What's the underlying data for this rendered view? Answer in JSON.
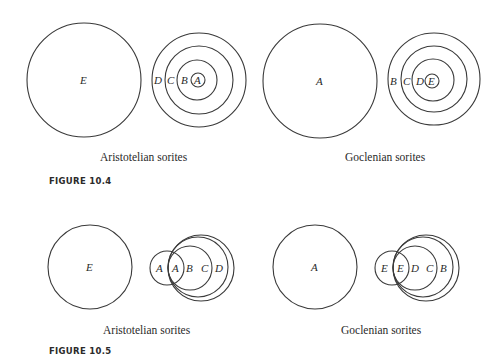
{
  "figures": [
    {
      "id": "fig-10-4",
      "figure_label": "FIGURE 10.4",
      "panels": [
        {
          "caption": "Aristotelian sorites",
          "big_circle": {
            "label": "E",
            "cx": 84,
            "cy": 80,
            "r": 57
          },
          "nested_circles": [
            {
              "label": "D",
              "cx": 199,
              "cy": 80,
              "r": 47,
              "label_x": 155
            },
            {
              "label": "C",
              "cx": 199,
              "cy": 80,
              "r": 34,
              "label_x": 169
            },
            {
              "label": "B",
              "cx": 199,
              "cy": 80,
              "r": 20,
              "label_x": 183
            },
            {
              "label": "A",
              "cx": 197,
              "cy": 80,
              "r": 7,
              "label_x": 193
            }
          ]
        },
        {
          "caption": "Goclenian sorites",
          "big_circle": {
            "label": "A",
            "cx": 320,
            "cy": 81,
            "r": 57
          },
          "nested_circles": [
            {
              "label": "B",
              "cx": 434,
              "cy": 79,
              "r": 46,
              "label_x": 390
            },
            {
              "label": "C",
              "cx": 434,
              "cy": 79,
              "r": 33,
              "label_x": 403
            },
            {
              "label": "D",
              "cx": 434,
              "cy": 79,
              "r": 21,
              "label_x": 416
            },
            {
              "label": "E",
              "cx": 432,
              "cy": 81,
              "r": 7,
              "label_x": 428
            }
          ]
        }
      ]
    },
    {
      "id": "fig-10-5",
      "figure_label": "FIGURE 10.5",
      "panels": [
        {
          "caption": "Aristotelian sorites",
          "big_circle": {
            "label": "E",
            "cx": 90,
            "cy": 267,
            "r": 42
          },
          "overlapping_circles": [
            {
              "label": "A",
              "cx": 167,
              "cy": 268,
              "r": 17,
              "label_x": 156
            },
            {
              "label": "A",
              "cx": 190,
              "cy": 268,
              "r": 22,
              "label_x": 173
            },
            {
              "label": "B",
              "cx": 198,
              "cy": 268,
              "r": 30,
              "label_x": 190
            },
            {
              "label": "C",
              "cx": 201,
              "cy": 268,
              "r": 33,
              "label_x": 204
            }
          ],
          "extra_label": {
            "label": "D",
            "x": 218,
            "y": 272
          }
        },
        {
          "caption": "Goclenian sorites",
          "big_circle": {
            "label": "A",
            "cx": 315,
            "cy": 267,
            "r": 42
          },
          "overlapping_circles": [
            {
              "label": "E",
              "cx": 392,
              "cy": 268,
              "r": 17,
              "label_x": 381
            },
            {
              "label": "E",
              "cx": 415,
              "cy": 268,
              "r": 22,
              "label_x": 398
            },
            {
              "label": "D",
              "cx": 423,
              "cy": 268,
              "r": 30,
              "label_x": 414
            },
            {
              "label": "C",
              "cx": 426,
              "cy": 268,
              "r": 33,
              "label_x": 428
            }
          ],
          "extra_label": {
            "label": "B",
            "x": 444,
            "y": 272
          }
        }
      ]
    }
  ],
  "text": {
    "fig104_left_caption": "Aristotelian sorites",
    "fig104_right_caption": "Goclenian sorites",
    "fig104_label": "FIGURE 10.4",
    "fig105_left_caption": "Aristotelian sorites",
    "fig105_right_caption": "Goclenian sorites",
    "fig105_label": "FIGURE 10.5",
    "labels": {
      "f4_big_left": "E",
      "f4_left_D": "D",
      "f4_left_C": "C",
      "f4_left_B": "B",
      "f4_left_A": "A",
      "f4_big_right": "A",
      "f4_right_B": "B",
      "f4_right_C": "C",
      "f4_right_D": "D",
      "f4_right_E": "E",
      "f5_big_left": "E",
      "f5_left_A1": "A",
      "f5_left_A2": "A",
      "f5_left_B": "B",
      "f5_left_C": "C",
      "f5_left_D": "D",
      "f5_big_right": "A",
      "f5_right_E1": "E",
      "f5_right_E2": "E",
      "f5_right_D": "D",
      "f5_right_C": "C",
      "f5_right_B": "B"
    }
  }
}
